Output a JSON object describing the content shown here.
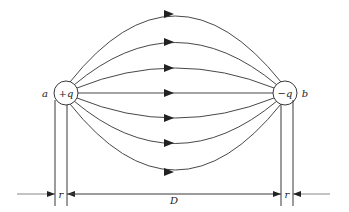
{
  "diagram": {
    "charges": [
      {
        "id": "left",
        "label": "+q",
        "point_label": "a",
        "cx": 66,
        "cy": 93,
        "r": 12
      },
      {
        "id": "right",
        "label": "−q",
        "point_label": "b",
        "cx": 285,
        "cy": 93,
        "r": 12
      }
    ],
    "field_line_apex_y": [
      14,
      42,
      68,
      93,
      118,
      143,
      172
    ],
    "dimensions": {
      "left_radius_label": "r",
      "separation_label": "D",
      "right_radius_label": "r"
    },
    "colors": {
      "line": "#222222",
      "background": "#ffffff"
    }
  }
}
